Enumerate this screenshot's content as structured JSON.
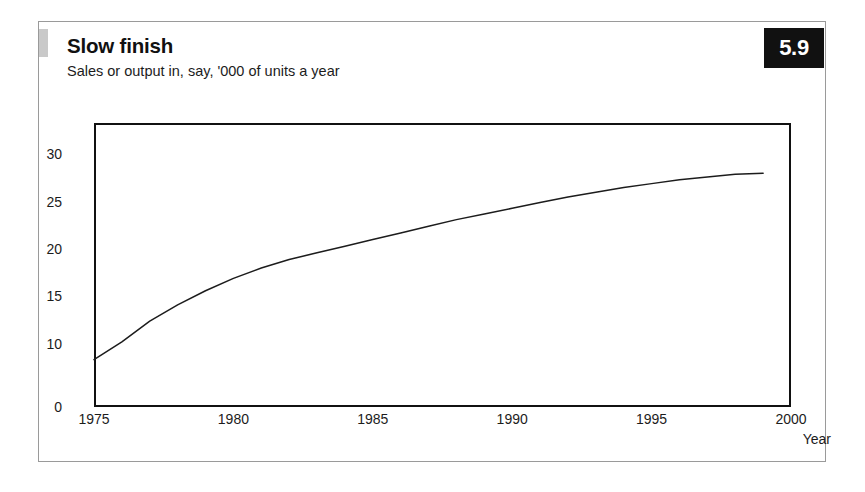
{
  "card": {
    "title": "Slow finish",
    "subtitle": "Sales or output in, say, '000 of units a year",
    "badge": "5.9",
    "marker_color": "#c9c9c9",
    "border_color": "#9a9a9a",
    "badge_bg": "#111111",
    "badge_fg": "#ffffff"
  },
  "chart_data": {
    "type": "line",
    "title": "Slow finish",
    "subtitle": "Sales or output in, say, '000 of units a year",
    "xlabel": "Year",
    "ylabel": "",
    "xlim": [
      1975,
      2000
    ],
    "ylim": [
      0,
      30
    ],
    "grid": false,
    "legend": null,
    "line_color": "#1c1c1c",
    "x_ticks": [
      "1975",
      "1980",
      "1985",
      "1990",
      "1995",
      "2000"
    ],
    "x_tick_values": [
      1975,
      1980,
      1985,
      1990,
      1995,
      2000
    ],
    "y_ticks": [
      "0",
      "10",
      "15",
      "20",
      "25",
      "30"
    ],
    "y_tick_values": [
      0,
      10,
      15,
      20,
      25,
      30
    ],
    "series": [
      {
        "name": "Sales or output",
        "x": [
          1975,
          1976,
          1977,
          1978,
          1979,
          1980,
          1981,
          1982,
          1983,
          1984,
          1985,
          1986,
          1987,
          1988,
          1989,
          1990,
          1991,
          1992,
          1993,
          1994,
          1995,
          1996,
          1997,
          1998,
          1999
        ],
        "values": [
          7.5,
          10.2,
          12.4,
          14.1,
          15.6,
          16.9,
          18.0,
          18.9,
          19.6,
          20.3,
          21.0,
          21.7,
          22.4,
          23.1,
          23.7,
          24.3,
          24.9,
          25.5,
          26.0,
          26.5,
          26.9,
          27.3,
          27.6,
          27.9,
          28.0
        ]
      }
    ],
    "annotation": "Curve rises steeply from 1975 then flattens toward 28 by 1999"
  }
}
